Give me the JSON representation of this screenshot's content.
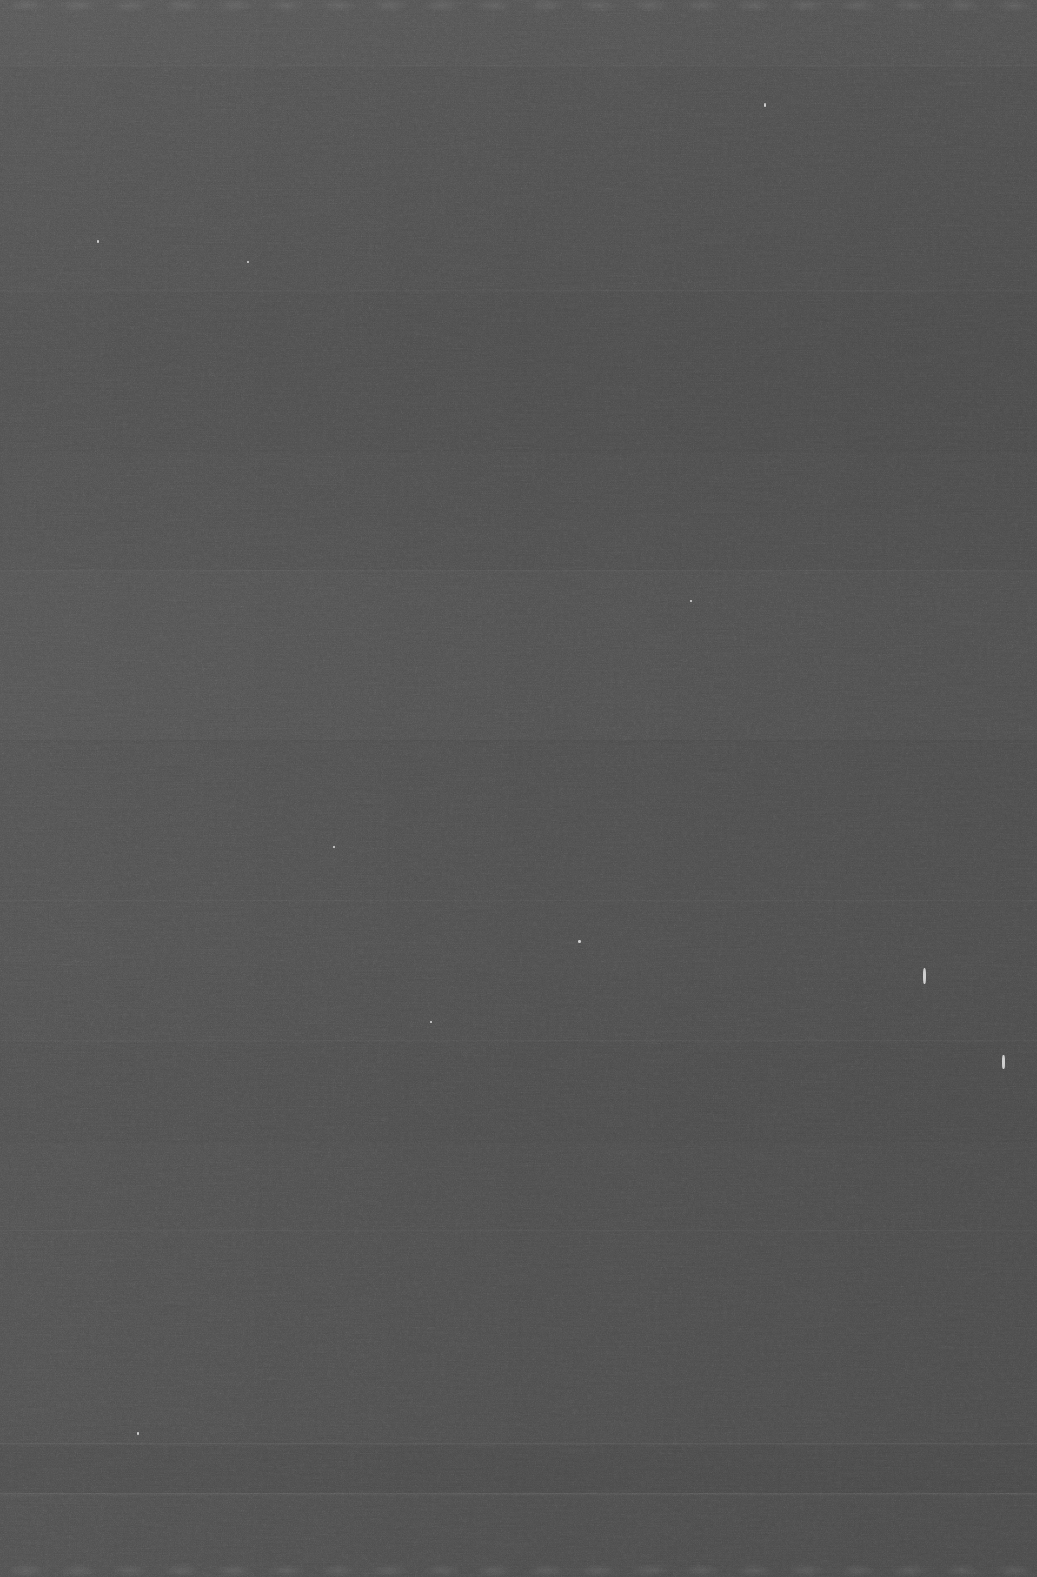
{
  "image": {
    "kind": "uniform-dark-noise-field",
    "description": "Essentially featureless dark gray frame dominated by fine sensor noise; no text, icons, widgets or chart content is present.",
    "width_px": 1037,
    "height_px": 1577,
    "base_color": "#4a4a4a",
    "tone_range": {
      "darkest": "#3d3d3d",
      "typical": "#4a4a4a",
      "lightest": "#565656"
    },
    "has_text": false,
    "has_ui_controls": false,
    "has_chart": false
  },
  "gradients": {
    "horizontal": "slightly darker toward the right edge",
    "vertical": "slightly lighter at the top, darker toward the bottom"
  },
  "edges": {
    "top_strip": {
      "label": "scalloped lighter strip",
      "height_px": 11,
      "scallop_period_px": 52,
      "color": "#565656"
    },
    "bottom_strip": {
      "label": "scalloped lighter strip",
      "height_px": 13,
      "scallop_period_px": 52,
      "color": "#555555"
    }
  },
  "scan_bands": [
    {
      "y": 65,
      "tone": "lighter",
      "strength": 0.03
    },
    {
      "y": 290,
      "tone": "lighter",
      "strength": 0.026
    },
    {
      "y": 450,
      "tone": "darker",
      "strength": 0.022
    },
    {
      "y": 570,
      "tone": "lighter",
      "strength": 0.024
    },
    {
      "y": 740,
      "tone": "darker",
      "strength": 0.02
    },
    {
      "y": 900,
      "tone": "lighter",
      "strength": 0.022
    },
    {
      "y": 1040,
      "tone": "lighter",
      "strength": 0.026
    },
    {
      "y": 1140,
      "tone": "darker",
      "strength": 0.02
    },
    {
      "y": 1230,
      "tone": "lighter",
      "strength": 0.022
    },
    {
      "y": 1443,
      "tone": "lighter",
      "strength": 0.052
    },
    {
      "y": 1493,
      "tone": "lighter",
      "strength": 0.06
    }
  ],
  "tonal_bands": [
    {
      "y": 0,
      "height": 65,
      "shade": "lighter",
      "strength": 0.016
    },
    {
      "y": 290,
      "height": 160,
      "shade": "darker",
      "strength": 0.012
    },
    {
      "y": 570,
      "height": 170,
      "shade": "lighter",
      "strength": 0.01
    },
    {
      "y": 1040,
      "height": 100,
      "shade": "darker",
      "strength": 0.012
    },
    {
      "y": 1443,
      "height": 50,
      "shade": "darker",
      "strength": 0.016
    }
  ],
  "specks": [
    {
      "x": 1002,
      "y": 1055,
      "width": 3,
      "height": 14,
      "note": "bright vertical dust streak near right edge"
    },
    {
      "x": 923,
      "y": 968,
      "width": 3,
      "height": 16,
      "note": "bright tapered streak"
    },
    {
      "x": 97,
      "y": 240,
      "width": 2,
      "height": 3,
      "note": "small bright pixel"
    },
    {
      "x": 764,
      "y": 103,
      "width": 2,
      "height": 4,
      "note": "small bright pixel"
    },
    {
      "x": 690,
      "y": 600,
      "width": 2,
      "height": 2,
      "note": "small bright pixel"
    },
    {
      "x": 247,
      "y": 261,
      "width": 2,
      "height": 2,
      "note": "small bright pixel"
    },
    {
      "x": 578,
      "y": 940,
      "width": 3,
      "height": 3,
      "note": "faint bright blotch"
    },
    {
      "x": 137,
      "y": 1432,
      "width": 2,
      "height": 3,
      "note": "small bright pixel"
    },
    {
      "x": 333,
      "y": 846,
      "width": 2,
      "height": 2,
      "note": "small bright pixel"
    },
    {
      "x": 430,
      "y": 1021,
      "width": 2,
      "height": 2,
      "note": "small bright pixel"
    }
  ],
  "noise": {
    "character": "fine-grained monochrome sensor grain with faint horizontal streaking",
    "fine_frequency": 0.85,
    "coarse_frequency": 0.22,
    "streak_frequency_x": 0.02,
    "streak_frequency_y": 0.95
  }
}
